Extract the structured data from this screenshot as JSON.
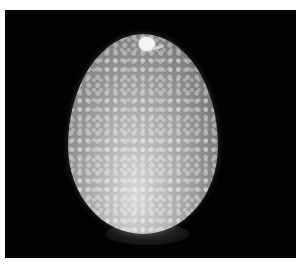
{
  "image": {
    "subject": "speckled egg illuminated from below on black background",
    "alt": "Candled speckled egg with small bright spot near top",
    "colors": {
      "background": "#020202",
      "border": "#ffffff",
      "egg_light": "#d8d8d8",
      "egg_dark": "#4e4e4e",
      "highlight": "#f4f4f4"
    }
  }
}
